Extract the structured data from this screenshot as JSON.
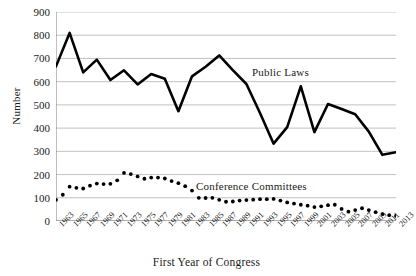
{
  "chart_data": {
    "type": "line",
    "title": "",
    "xlabel": "First Year of Congress",
    "ylabel": "Number",
    "ylim": [
      0,
      900
    ],
    "ytick_step": 100,
    "grid": true,
    "legend_position": "inline-annotation",
    "x": [
      1963,
      1965,
      1967,
      1969,
      1971,
      1973,
      1975,
      1977,
      1979,
      1981,
      1983,
      1985,
      1987,
      1989,
      1991,
      1993,
      1995,
      1997,
      1999,
      2001,
      2003,
      2005,
      2007,
      2009,
      2011,
      2013
    ],
    "categories": [
      "1963",
      "1965",
      "1967",
      "1969",
      "1971",
      "1973",
      "1975",
      "1977",
      "1979",
      "1981",
      "1983",
      "1985",
      "1987",
      "1989",
      "1991",
      "1993",
      "1995",
      "1997",
      "1999",
      "2001",
      "2003",
      "2005",
      "2007",
      "2009",
      "2011",
      "2013"
    ],
    "series": [
      {
        "name": "Public Laws",
        "style": "solid-line",
        "color": "#000000",
        "values": [
          666,
          810,
          640,
          695,
          607,
          649,
          588,
          633,
          613,
          473,
          623,
          664,
          713,
          650,
          590,
          465,
          333,
          404,
          580,
          383,
          504,
          482,
          460,
          385,
          285,
          296
        ]
      },
      {
        "name": "Conference Committees",
        "style": "dotted-markers",
        "color": "#000000",
        "values": [
          91,
          148,
          143,
          161,
          161,
          207,
          187,
          187,
          172,
          100,
          100,
          85,
          91,
          95,
          95,
          78,
          67,
          60,
          70,
          40,
          55,
          34,
          23,
          15,
          12,
          10
        ],
        "dense_points_x": [
          1963,
          1964,
          1965,
          1966,
          1967,
          1968,
          1969,
          1970,
          1971,
          1972,
          1973,
          1974,
          1975,
          1976,
          1977,
          1978,
          1979,
          1980,
          1981,
          1982,
          1983,
          1984,
          1985,
          1986,
          1987,
          1988,
          1989,
          1990,
          1991,
          1992,
          1993,
          1994,
          1995,
          1996,
          1997,
          1998,
          1999,
          2000,
          2001,
          2002,
          2003,
          2004,
          2005,
          2006,
          2007,
          2008,
          2009,
          2010,
          2011,
          2012,
          2013
        ],
        "dense_points_y": [
          91,
          113,
          148,
          143,
          140,
          152,
          161,
          159,
          160,
          175,
          207,
          202,
          192,
          182,
          187,
          187,
          183,
          172,
          163,
          150,
          131,
          100,
          99,
          100,
          91,
          83,
          84,
          88,
          90,
          92,
          94,
          94,
          95,
          88,
          80,
          75,
          70,
          66,
          60,
          63,
          68,
          70,
          52,
          40,
          47,
          55,
          47,
          38,
          30,
          25,
          22,
          18,
          15,
          14,
          12,
          10
        ]
      }
    ],
    "annotations": [
      {
        "text": "Public Laws",
        "x": 1991,
        "y": 690
      },
      {
        "text": "Conference Committees",
        "x": 1985,
        "y": 175
      }
    ]
  },
  "axes": {
    "y_ticks": [
      "900",
      "800",
      "700",
      "600",
      "500",
      "400",
      "300",
      "200",
      "100",
      "0"
    ],
    "x_ticks": [
      "1963",
      "1965",
      "1967",
      "1969",
      "1971",
      "1973",
      "1975",
      "1977",
      "1979",
      "1981",
      "1983",
      "1985",
      "1987",
      "1989",
      "1991",
      "1993",
      "1995",
      "1997",
      "1999",
      "2001",
      "2003",
      "2005",
      "2007",
      "2009",
      "2011",
      "2013"
    ],
    "y_title": "Number",
    "x_title": "First Year of Congress"
  },
  "labels": {
    "public_laws": "Public Laws",
    "conference_committees": "Conference Committees"
  },
  "colors": {
    "line": "#000000",
    "grid": "#b3b3b3",
    "axis": "#808080",
    "text": "#1a1a1a",
    "background": "#ffffff"
  }
}
